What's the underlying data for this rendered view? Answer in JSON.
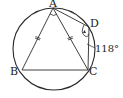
{
  "figure": {
    "type": "geometry-diagram",
    "colors": {
      "stroke": "#2a2a2a",
      "background": "#ffffff",
      "text": "#222222"
    },
    "circle": {
      "cx": 54,
      "cy": 49,
      "r": 41
    },
    "points": {
      "A": {
        "label": "A",
        "x": 53,
        "y": 8
      },
      "B": {
        "label": "B",
        "x": 22,
        "y": 70
      },
      "C": {
        "label": "C",
        "x": 88,
        "y": 70
      },
      "D": {
        "label": "D",
        "x": 89,
        "y": 27
      }
    },
    "segments": [
      "AB",
      "AC",
      "BC",
      "AD",
      "DC"
    ],
    "equal_marks": [
      "AB",
      "AC"
    ],
    "angle_marks": [
      "BAC",
      "ADC"
    ],
    "annotations": {
      "angle_ADC": "118°"
    }
  }
}
